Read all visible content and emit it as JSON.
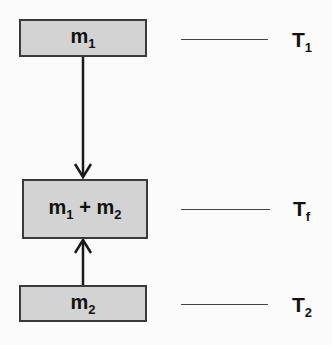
{
  "boxes": {
    "m1": {
      "base": "m",
      "sub": "1"
    },
    "combined": {
      "base1": "m",
      "sub1": "1",
      "plus": " + ",
      "base2": "m",
      "sub2": "2"
    },
    "m2": {
      "base": "m",
      "sub": "2"
    }
  },
  "temperatures": {
    "t1": {
      "base": "T",
      "sub": "1"
    },
    "tf": {
      "base": "T",
      "sub": "f"
    },
    "t2": {
      "base": "T",
      "sub": "2"
    }
  },
  "arrows": [
    {
      "from": "m1",
      "to": "combined",
      "direction": "down"
    },
    {
      "from": "m2",
      "to": "combined",
      "direction": "up"
    }
  ],
  "colors": {
    "box_fill": "#d3d3d3",
    "border": "#3a3a3a",
    "text": "#111111"
  }
}
